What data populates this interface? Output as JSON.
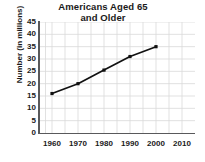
{
  "chart_data": {
    "type": "line",
    "title": "Americans Aged 65 and Older",
    "title_lines": [
      "Americans Aged 65",
      "and Older"
    ],
    "xlabel": "",
    "ylabel": "Number (in millions)",
    "x": [
      1960,
      1970,
      1980,
      1990,
      2000
    ],
    "values": [
      16,
      20,
      25.5,
      31,
      35
    ],
    "series": [
      {
        "name": "Americans Aged 65 and Older",
        "values": [
          16,
          20,
          25.5,
          31,
          35
        ]
      }
    ],
    "xlim": [
      1955,
      2015
    ],
    "ylim": [
      0,
      45
    ],
    "x_ticks": [
      1960,
      1970,
      1980,
      1990,
      2000,
      2010
    ],
    "x_tick_labels": [
      "1960",
      "1970",
      "1980",
      "1990",
      "2000",
      "2010"
    ],
    "y_ticks": [
      0,
      5,
      10,
      15,
      20,
      25,
      30,
      35,
      40,
      45
    ],
    "y_tick_labels": [
      "0",
      "5",
      "10",
      "15",
      "20",
      "25",
      "30",
      "35",
      "40",
      "45"
    ],
    "grid": true,
    "legend": false,
    "marker": "square",
    "colors": {
      "line": "#111111",
      "marker": "#111111",
      "grid": "#d9d9d9",
      "axis": "#59595b",
      "text": "#1a1a1a",
      "background": "#ffffff"
    }
  }
}
